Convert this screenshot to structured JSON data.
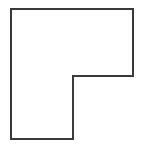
{
  "canvas": {
    "width": 143,
    "height": 147,
    "background_color": "#ffffff"
  },
  "figure": {
    "name": "l-shaped-polygon",
    "shape_type": "polygon",
    "vertex_count": 6,
    "fill_color": "#ffffff",
    "stroke_color": "#3a3a3a",
    "stroke_width": 2,
    "points": "11,9 133,9 133,76 73,76 73,139 11,139",
    "vertices": [
      {
        "label": "top-left",
        "x": 11,
        "y": 9
      },
      {
        "label": "top-right",
        "x": 133,
        "y": 9
      },
      {
        "label": "right-notch-bottom",
        "x": 133,
        "y": 76
      },
      {
        "label": "inner-concave-corner",
        "x": 73,
        "y": 76
      },
      {
        "label": "leg-bottom-right",
        "x": 73,
        "y": 139
      },
      {
        "label": "bottom-left",
        "x": 11,
        "y": 139
      }
    ]
  },
  "chart_data": {
    "type": "scatter",
    "title": "",
    "xlabel": "",
    "ylabel": "",
    "xlim": [
      0,
      143
    ],
    "ylim": [
      0,
      147
    ],
    "grid": false,
    "legend": "none",
    "series": [
      {
        "name": "l-shaped-polygon-outline",
        "closed": true,
        "x": [
          11,
          133,
          133,
          73,
          73,
          11
        ],
        "y": [
          9,
          9,
          76,
          76,
          139,
          139
        ]
      }
    ]
  }
}
